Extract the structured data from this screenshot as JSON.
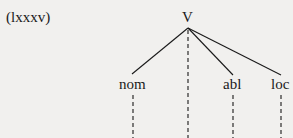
{
  "example_number": "(lxxxv)",
  "tree": {
    "root": {
      "label": "V",
      "x": 188,
      "y": 17
    },
    "children": [
      {
        "label": "nom",
        "x": 133,
        "y": 84
      },
      {
        "label": "abl",
        "x": 233,
        "y": 84
      },
      {
        "label": "loc",
        "x": 281,
        "y": 84
      }
    ]
  }
}
